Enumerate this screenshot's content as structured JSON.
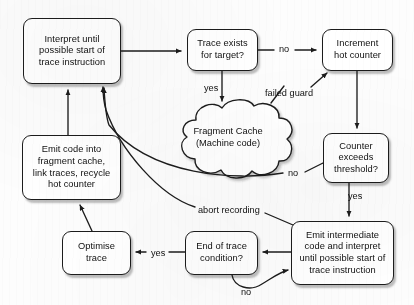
{
  "diagram": {
    "background_color": "#fdfdfd",
    "stroke_color": "#1c1c1c",
    "text_color": "#101010",
    "nodes": [
      {
        "id": "interpret",
        "label": "Interpret until\npossible start of\ntrace instruction",
        "shape": "rounded-rect",
        "x": 23,
        "y": 18,
        "w": 98,
        "h": 66
      },
      {
        "id": "trace_exists",
        "label": "Trace exists\nfor target?",
        "shape": "rounded-rect",
        "x": 187,
        "y": 29,
        "w": 71,
        "h": 42
      },
      {
        "id": "increment",
        "label": "Increment\nhot counter",
        "shape": "rounded-rect",
        "x": 322,
        "y": 29,
        "w": 71,
        "h": 42
      },
      {
        "id": "counter",
        "label": "Counter\nexceeds\nthreshold?",
        "shape": "rounded-rect",
        "x": 323,
        "y": 133,
        "w": 66,
        "h": 50
      },
      {
        "id": "fragment",
        "label": "Fragment Cache\n(Machine code)",
        "shape": "cloud",
        "x": 166,
        "y": 104,
        "w": 124,
        "h": 76
      },
      {
        "id": "emit_inter",
        "label": "Emit intermediate\ncode and interpret\nuntil possible start of\ntrace instruction",
        "shape": "rounded-rect",
        "x": 291,
        "y": 221,
        "w": 103,
        "h": 64
      },
      {
        "id": "emit_code",
        "label": "Emit code into\nfragment cache,\nlink traces, recycle\nhot counter",
        "shape": "rounded-rect",
        "x": 22,
        "y": 135,
        "w": 99,
        "h": 65
      },
      {
        "id": "optimise",
        "label": "Optimise\ntrace",
        "shape": "rounded-rect",
        "x": 62,
        "y": 231,
        "w": 69,
        "h": 44
      },
      {
        "id": "end_of_trace",
        "label": "End of trace\ncondition?",
        "shape": "rounded-rect",
        "x": 185,
        "y": 231,
        "w": 73,
        "h": 44
      }
    ],
    "edge_labels": [
      {
        "id": "no_trace_exists",
        "text": "no",
        "x": 279,
        "y": 44
      },
      {
        "id": "yes_trace_exists",
        "text": "yes",
        "x": 204,
        "y": 83
      },
      {
        "id": "failed_guard",
        "text": "failed guard",
        "x": 265,
        "y": 88
      },
      {
        "id": "no_counter",
        "text": "no",
        "x": 288,
        "y": 168
      },
      {
        "id": "yes_counter",
        "text": "yes",
        "x": 348,
        "y": 191
      },
      {
        "id": "abort_recording",
        "text": "abort recording",
        "x": 198,
        "y": 205
      },
      {
        "id": "yes_end_trace",
        "text": "yes",
        "x": 151,
        "y": 248
      },
      {
        "id": "no_end_trace",
        "text": "no",
        "x": 241,
        "y": 287
      }
    ]
  }
}
